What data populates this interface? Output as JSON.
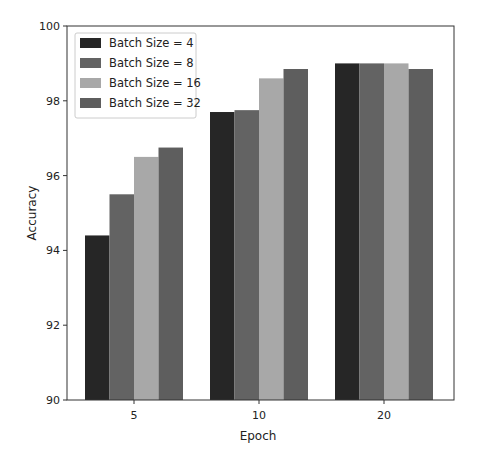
{
  "chart_data": {
    "type": "bar",
    "title": "",
    "xlabel": "Epoch",
    "ylabel": "Accuracy",
    "categories": [
      "5",
      "10",
      "20"
    ],
    "series": [
      {
        "name": "Batch Size = 4",
        "color": "#262626",
        "values": [
          94.4,
          97.7,
          99.0
        ]
      },
      {
        "name": "Batch Size = 8",
        "color": "#636363",
        "values": [
          95.5,
          97.75,
          99.0
        ]
      },
      {
        "name": "Batch Size = 16",
        "color": "#a8a8a8",
        "values": [
          96.5,
          98.6,
          99.0
        ]
      },
      {
        "name": "Batch Size = 32",
        "color": "#5e5e5e",
        "values": [
          96.75,
          98.85,
          98.85
        ]
      }
    ],
    "ylim": [
      90,
      100
    ],
    "yticks": [
      90,
      92,
      94,
      96,
      98,
      100
    ],
    "grid": false,
    "legend_position": "upper left"
  }
}
